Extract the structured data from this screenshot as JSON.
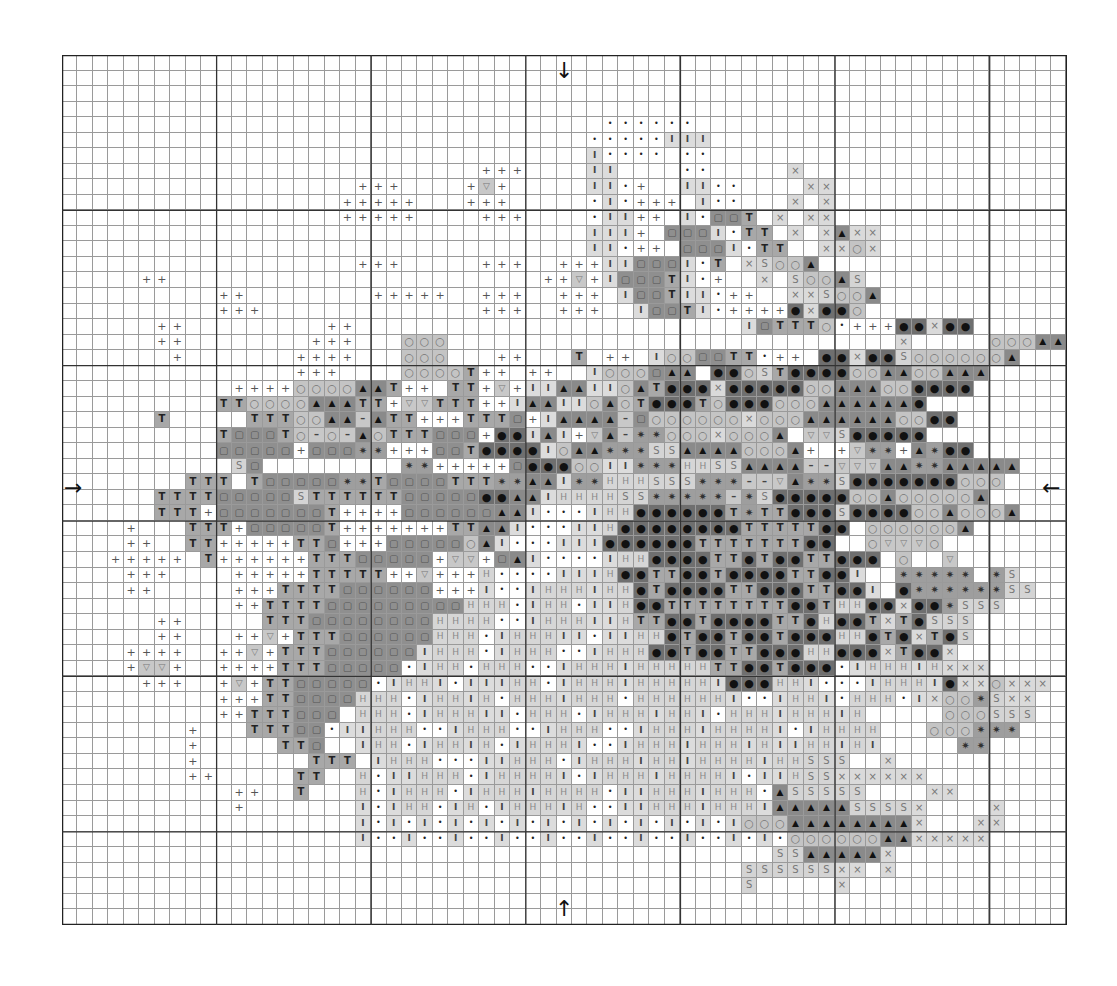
{
  "chart": {
    "type": "cross-stitch-pattern",
    "columns": 65,
    "rows": 56,
    "major_line_every": 10,
    "center_markers": {
      "top": "↓",
      "bottom": "↑",
      "left": "→",
      "right": "←"
    },
    "legend_symbols": {
      "p": {
        "glyph": "+",
        "shade": "#ffffff"
      },
      "v": {
        "glyph": "▽",
        "shade": "#c8c8c8"
      },
      "T": {
        "glyph": "T",
        "shade": "#a8a8a8"
      },
      "q": {
        "glyph": "▢",
        "shade": "#8f8f8f"
      },
      "o": {
        "glyph": "○",
        "shade": "#c4c4c4"
      },
      "a": {
        "glyph": "▲",
        "shade": "#8a8a8a"
      },
      "b": {
        "glyph": "●",
        "shade": "#6f6f6f"
      },
      "m": {
        "glyph": "–",
        "shade": "#c8c8c8"
      },
      "s": {
        "glyph": "✷",
        "shade": "#9e9e9e"
      },
      "S": {
        "glyph": "S",
        "shade": "#d4d4d4"
      },
      "x": {
        "glyph": "×",
        "shade": "#dadada"
      },
      "I": {
        "glyph": "I",
        "shade": "#dcdcdc"
      },
      "d": {
        "glyph": "•",
        "shade": "#ffffff"
      },
      "H": {
        "glyph": "H",
        "shade": "#d6d6d6"
      }
    },
    "pattern_rows": [
      ".................................................................",
      ".................................................................",
      ".................................................................",
      ".................................................................",
      "...................................dddddd........................",
      "..................................dddddIII.......................",
      "..................................Idddd.dd.......................",
      "...........................ppp....II....dd.....x.................",
      "...................ppp....pvp.....IIdp..IIdd....xx...............",
      "..................ppppp...ppp.....dIdppp.Idd...x.x...............",
      "..................ppppp....ppp....dIIpp.IdqqT.x.xx...............",
      "..................................IIIp.qqqIdTT.x.xaxx............",
      "..................................IIdpp.qqqIdTT..xxox............",
      "...................ppp.....ppp..pppIIqqqIdT.xSooa................",
      ".....pp........................ppvpIqqqTIdp..x.SooaS.............",
      "..........pp........ppppp..ppp..ppp.IqqTIIdpp..xxSooa............",
      "..........ppp..............ppp..ppp..IqqTIdppppbxbbo.............",
      "......pp.........pp.........................IqTTTodpppbbxbb......",
      "......pp........ppp...ooo.............................x.....oooaa.",
      ".......p.......pppp...ooo...pp...T.pp.IooqqTTdpp.bbxbbSooooooa..",
      "...............ppp....ooooTpp.pp..Ioooqaa.bboSTbbbbooaaooaaa.....",
      "...........ppppooooaaTpp.TTpvpIIaaIIoaTbbbxbbbbbooaaaoobbbb......",
      "..........TTooooaaaTTpvvTTTppIaaIIoaoTbbbTobbboooaaaaaab.......",
      "......T.....TTTooaamaTTpppTTTqpIaaaamqooooooxoooaaaaaaoobb......",
      "..........TqqqTomomaoTTTqqqpbbIaIpvamssoooxoooa+vvSbbbbb.....",
      "..........qqqqqpqqqsspppqqTbbbbIoaasssSSaaaaoooap+pvsspasbb....",
      "...........Sq.........sspppppqbbbooIIsssHHSSaaaammvvvaassaaaaa..",
      "........TTT.TqqqqqssTqqqqTTTssaaIssHHHSSSsssmmvassSbbbbbbbooo..",
      "......TTTTqqqqqSTTTTTTqqqqqbbaaIHHHHSSsssssmsSbbbbbooaoooooa...",
      "......TTTpqqqqqqqTppppqqqqqqaaIdddIHHbbbbbbTsTTbbbSbbbbooaoooa..",
      "....p...TTTpqqqqqTpppppppTTaaIdddIIHbbbbbbbbTTTTTbb.ooooooa....",
      "....pp..TTpppppTTqpppqqqqqoaIdddIIIbbbbbbTTTTTTTbb..ovvvo.....",
      "...ppppp.TppppppTTTqqqqqpvvpqaIddddIHHbbbbTTbTbbTTbbb.o--v.....",
      "....ppp....pppppTTTTTppvpppHddddIIIHbbTTbbTbbbbTTbbI..sssss-sS..",
      "....pp.....pppTTTTqqqqqqpppIddIHHHIHHbTbbbbTTbbbTTbbI.bssssssSS.",
      "...........ppTTTTqqqqqqqqqHHHdIHHdIIHbbTTTTTTTTbbTHHbbxbbsSSS.",
      "......pp.....TTTqqqqqqqqHHHHddIHHHIIHTTbbTbbbbTTbHbbTxTbSSS....",
      "......pp...ppvpTTTqqqqqqHHHdIHHHIIdIIHHbTbbTbbTbbbHHbTbxTbS....",
      "....pppp..ppvpTTTqqqqqqIHHHdIHHHddIHHHbbTbbTTbbbHHbbbxTbbx....",
      "....pvvp..ppppTTTqqqqqdIHHdHHHddIHHHIHHHHHTTbbTbbbdIHHHIHxxx......",
      ".....ppp..pvpTTqqqqqdIHHIdIIIHHdIHHHIHHHHHIbbbHHIdddIHHHIbxxoxxx..",
      "..........pppTTqqqqHHHdIHHIHdHHHIHHHdHHHHHHIddIHHIdHHHdIxoosSxx.",
      "..........ppTTTqqq.HHHdIHHHIIdHHHdIHHHIHHIdHHHIHHHIH.....oooSSS.",
      "........p...TTTqqdIIHHHddIHHHddIHHHddIHHHIHHHHIdIHHHH...ooosss..",
      "........p.....TTq..IHHdIHHIHdIHHHIddIHHHIHHHIHIIHHIHI.....ss.",
      "........p.......TTT.IHHHdddIIHHHdIHHHIHHIHHHHIHHSSS..x.........",
      "........pp.....TT..HdIIHHHdIHHHHIdIHHHIHHHHIdIIHSSxxxxxx....",
      "...........pp..T...HdIHHHdIHHHIHHHHdIIHHHIHHHdaSSSSS....xx...",
      "...........p.......IdIHHdIHdIHHHIHddIIHHHIHHHIaaaaaSSSSx....x...",
      "...................IdIdIdIdIdIdIdIdIdIdIdIdIoooaaaaaaaax...xx...",
      "...................IddIddIddIddIddIddIddIddIdIdooooooaaxxxxx....",
      "..............................................SSaaaaax.........",
      "............................................SSSSSSxx.x.........",
      "............................................S.....x............",
      ".................................................................",
      "................................................................."
    ]
  }
}
